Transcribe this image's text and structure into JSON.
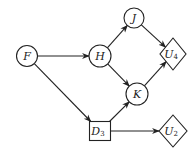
{
  "diagram": {
    "type": "influence-diagram",
    "nodes": [
      {
        "id": "F",
        "label": "F",
        "sub": "",
        "shape": "circle",
        "cx": 27,
        "cy": 56,
        "r": 10.5
      },
      {
        "id": "H",
        "label": "H",
        "sub": "",
        "shape": "circle",
        "cx": 100,
        "cy": 56,
        "r": 11
      },
      {
        "id": "J",
        "label": "J",
        "sub": "",
        "shape": "circle",
        "cx": 134,
        "cy": 18,
        "r": 10
      },
      {
        "id": "K",
        "label": "K",
        "sub": "",
        "shape": "circle",
        "cx": 137,
        "cy": 94,
        "r": 11
      },
      {
        "id": "D3",
        "label": "D",
        "sub": "3",
        "shape": "square",
        "cx": 100,
        "cy": 131,
        "w": 21,
        "h": 19
      },
      {
        "id": "U4",
        "label": "U",
        "sub": "4",
        "shape": "diamond",
        "cx": 173,
        "cy": 54,
        "rx": 13,
        "ry": 16
      },
      {
        "id": "U2",
        "label": "U",
        "sub": "2",
        "shape": "diamond",
        "cx": 173,
        "cy": 131,
        "rx": 14,
        "ry": 16
      }
    ],
    "edges": [
      {
        "from": "F",
        "to": "H"
      },
      {
        "from": "F",
        "to": "D3"
      },
      {
        "from": "H",
        "to": "J"
      },
      {
        "from": "H",
        "to": "K"
      },
      {
        "from": "J",
        "to": "U4"
      },
      {
        "from": "K",
        "to": "U4"
      },
      {
        "from": "D3",
        "to": "K"
      },
      {
        "from": "D3",
        "to": "U2"
      }
    ],
    "colors": {
      "stroke": "#222222",
      "fill": "#ffffff",
      "background": "#ffffff"
    }
  }
}
